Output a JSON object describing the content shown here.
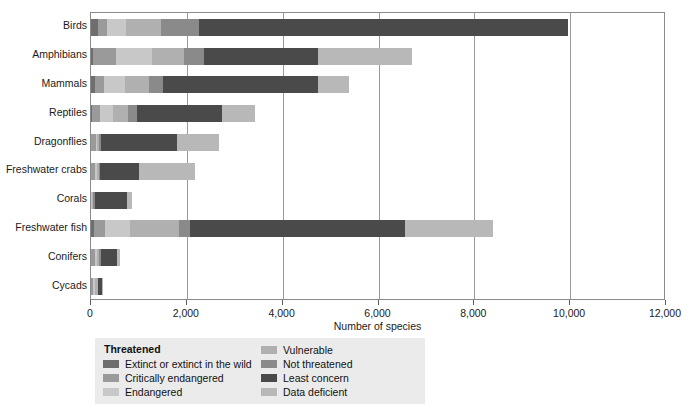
{
  "chart_data": {
    "type": "bar",
    "subtype": "stacked-horizontal",
    "title": "",
    "xlabel": "Number of species",
    "ylabel": "",
    "xlim": [
      0,
      12000
    ],
    "xticks": [
      0,
      2000,
      4000,
      6000,
      8000,
      10000,
      12000
    ],
    "xticklabels": [
      "0",
      "2,000",
      "4,000",
      "6,000",
      "8,000",
      "10,000",
      "12,000"
    ],
    "grid": true,
    "grid_axis": "x",
    "legend_position": "bottom-left",
    "legend_title": "Threatened",
    "categories": [
      "Birds",
      "Amphibians",
      "Mammals",
      "Reptiles",
      "Dragonflies",
      "Freshwater crabs",
      "Corals",
      "Freshwater fish",
      "Conifers",
      "Cycads"
    ],
    "series": [
      {
        "name": "Extinct or extinct in the wild",
        "color": "#6e6e6e",
        "values": [
          140,
          35,
          80,
          25,
          2,
          2,
          0,
          60,
          2,
          2
        ]
      },
      {
        "name": "Critically endangered",
        "color": "#9a9a9a",
        "values": [
          200,
          480,
          190,
          160,
          110,
          90,
          5,
          240,
          90,
          50
        ]
      },
      {
        "name": "Endangered",
        "color": "#c8c8c8",
        "values": [
          400,
          760,
          450,
          280,
          20,
          30,
          20,
          510,
          30,
          30
        ]
      },
      {
        "name": "Vulnerable",
        "color": "#b0b0b0",
        "values": [
          730,
          660,
          490,
          310,
          30,
          40,
          25,
          1020,
          50,
          55
        ]
      },
      {
        "name": "Not threatened",
        "color": "#8a8a8a",
        "values": [
          790,
          420,
          300,
          180,
          40,
          30,
          40,
          230,
          30,
          10
        ]
      },
      {
        "name": "Least concern",
        "color": "#4a4a4a",
        "values": [
          7690,
          2380,
          3230,
          1770,
          1600,
          800,
          660,
          4500,
          350,
          80
        ]
      },
      {
        "name": "Data deficient",
        "color": "#b8b8b8",
        "values": [
          0,
          1970,
          650,
          690,
          880,
          1180,
          100,
          1820,
          50,
          15
        ]
      }
    ],
    "totals": [
      9950,
      6705,
      5390,
      3415,
      2682,
      2172,
      850,
      8380,
      602,
      242
    ]
  },
  "legend": {
    "title": "Threatened",
    "left_column": [
      {
        "label": "Extinct or extinct in the wild",
        "color": "#6e6e6e"
      },
      {
        "label": "Critically endangered",
        "color": "#9a9a9a"
      },
      {
        "label": "Endangered",
        "color": "#c8c8c8"
      }
    ],
    "right_column": [
      {
        "label": "Vulnerable",
        "color": "#b0b0b0"
      },
      {
        "label": "Not threatened",
        "color": "#8a8a8a"
      },
      {
        "label": "Least concern",
        "color": "#4a4a4a"
      },
      {
        "label": "Data deficient",
        "color": "#b8b8b8"
      }
    ]
  },
  "colors": {
    "frame": "#8a8a8a",
    "gridline": "#9a9a9a",
    "legend_background": "#ebebeb",
    "text": "#1a1a1a",
    "background": "#ffffff"
  }
}
